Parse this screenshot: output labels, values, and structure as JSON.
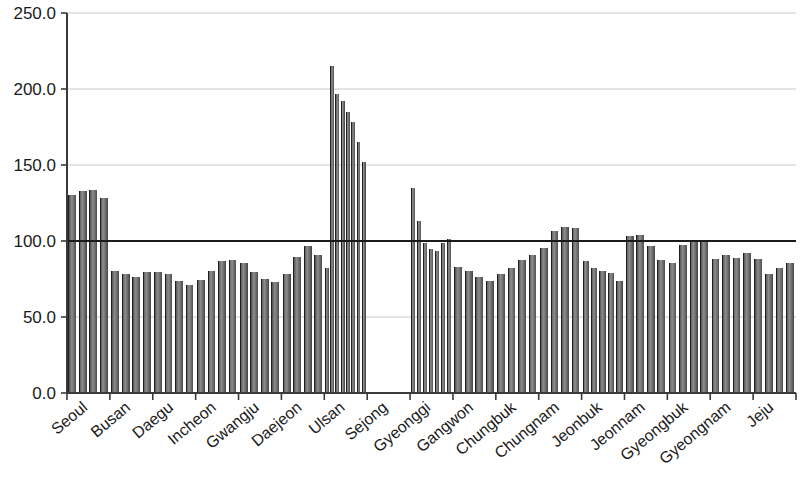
{
  "chart_data": {
    "type": "bar",
    "title": "",
    "subtitle": "",
    "xlabel": "",
    "ylabel": "",
    "ylim": [
      0.0,
      250.0
    ],
    "ytick_labels": [
      "0.0",
      "50.0",
      "100.0",
      "150.0",
      "200.0",
      "250.0"
    ],
    "ytick_values": [
      0.0,
      50.0,
      100.0,
      150.0,
      200.0,
      250.0
    ],
    "grid": true,
    "grid_axis": "y",
    "legend": "none",
    "reference_line": {
      "value": 100.0,
      "label": "",
      "color": "#1a1a1a"
    },
    "bar_color": "#5a5a5a",
    "categories": [
      "Seoul",
      "Busan",
      "Daegu",
      "Incheon",
      "Gwangju",
      "Daejeon",
      "Ulsan",
      "Sejong",
      "Gyeonggi",
      "Gangwon",
      "Chungbuk",
      "Chungnam",
      "Jeonbuk",
      "Jeonnam",
      "Gyeongbuk",
      "Gyeongnam",
      "Jeju"
    ],
    "groups": [
      {
        "category": "Seoul",
        "values": [
          130.5,
          133.0,
          133.5,
          128.5
        ]
      },
      {
        "category": "Busan",
        "values": [
          80.0,
          78.5,
          76.0,
          79.5
        ]
      },
      {
        "category": "Daegu",
        "values": [
          79.5,
          78.0,
          73.5,
          71.0
        ]
      },
      {
        "category": "Incheon",
        "values": [
          74.5,
          80.5,
          87.0,
          87.5
        ]
      },
      {
        "category": "Gwangju",
        "values": [
          85.5,
          79.5,
          75.0,
          73.0
        ]
      },
      {
        "category": "Daejeon",
        "values": [
          78.0,
          89.5,
          97.0,
          90.5
        ]
      },
      {
        "category": "Ulsan",
        "values": [
          82.5,
          215.0,
          197.0,
          192.0,
          185.0,
          178.0,
          165.0,
          152.0
        ]
      },
      {
        "category": "Sejong",
        "values": []
      },
      {
        "category": "Gyeonggi",
        "values": [
          135.0,
          113.0,
          98.5,
          95.0,
          93.5,
          98.5,
          101.5
        ]
      },
      {
        "category": "Gangwon",
        "values": [
          83.0,
          80.5,
          76.5,
          74.0
        ]
      },
      {
        "category": "Chungbuk",
        "values": [
          78.5,
          82.5,
          87.5,
          91.0
        ]
      },
      {
        "category": "Chungnam",
        "values": [
          95.5,
          106.5,
          109.5,
          108.5
        ]
      },
      {
        "category": "Jeonbuk",
        "values": [
          87.0,
          82.5,
          80.5,
          79.0,
          73.5
        ]
      },
      {
        "category": "Jeonnam",
        "values": [
          103.5,
          104.0,
          96.5,
          87.5
        ]
      },
      {
        "category": "Gyeongbuk",
        "values": [
          85.5,
          97.5,
          99.5,
          100.0
        ]
      },
      {
        "category": "Gyeongnam",
        "values": [
          88.0,
          90.5,
          89.0,
          92.0
        ]
      },
      {
        "category": "Jeju",
        "values": [
          88.0,
          78.5,
          82.0,
          85.5
        ]
      }
    ]
  },
  "axes": {
    "y_axis_name": "y-axis",
    "x_axis_name": "x-axis"
  }
}
